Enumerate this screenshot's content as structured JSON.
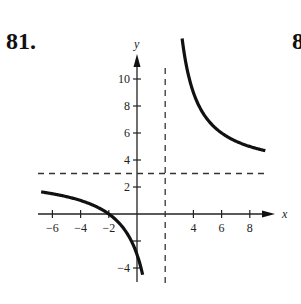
{
  "problem": {
    "number": "81.",
    "next_number_partial": "8"
  },
  "chart_data": {
    "type": "line",
    "title": "",
    "xlabel": "x",
    "ylabel": "y",
    "xlim": [
      -7,
      10
    ],
    "ylim": [
      -5,
      11
    ],
    "grid": false,
    "x_ticks": [
      -6,
      -4,
      -2,
      4,
      6,
      8
    ],
    "x_tick_labels": [
      "−6",
      "−4",
      "−2",
      "4",
      "6",
      "8"
    ],
    "y_ticks": [
      10,
      8,
      6,
      4,
      2,
      -4
    ],
    "y_tick_labels": [
      "10",
      "8",
      "6",
      "4",
      "2",
      "−4"
    ],
    "y_minor_ticks": [
      -2
    ],
    "asymptotes": {
      "vertical": 2,
      "horizontal": 3
    },
    "function_hint": "f(x) = 3(x + 2)/(x − 2)",
    "series": [
      {
        "name": "left branch",
        "x": [
          -6.8,
          -6,
          -5,
          -4,
          -3,
          -2,
          -1,
          -0.5,
          0,
          0.3,
          0.4
        ],
        "y": [
          1.64,
          1.5,
          1.29,
          1.0,
          0.6,
          0.0,
          -1.0,
          -1.8,
          -3.0,
          -4.24,
          -4.5
        ]
      },
      {
        "name": "right branch",
        "x": [
          3.2,
          3.5,
          4,
          5,
          6,
          7,
          8,
          9.1
        ],
        "y": [
          13.0,
          11.0,
          9.0,
          7.0,
          6.0,
          5.4,
          5.0,
          4.69
        ]
      }
    ]
  }
}
